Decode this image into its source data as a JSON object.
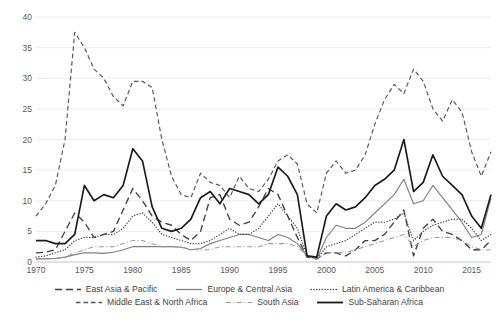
{
  "chart_data": {
    "type": "line",
    "title": "",
    "xlabel": "",
    "ylabel": "",
    "xlim": [
      1970,
      2017
    ],
    "ylim": [
      0,
      40
    ],
    "yticks": [
      0,
      5,
      10,
      15,
      20,
      25,
      30,
      35,
      40
    ],
    "xticks": [
      1970,
      1975,
      1980,
      1985,
      1990,
      1995,
      2000,
      2005,
      2010,
      2015
    ],
    "grid": "horizontal",
    "legend_position": "bottom",
    "x": [
      1970,
      1971,
      1972,
      1973,
      1974,
      1975,
      1976,
      1977,
      1978,
      1979,
      1980,
      1981,
      1982,
      1983,
      1984,
      1985,
      1986,
      1987,
      1988,
      1989,
      1990,
      1991,
      1992,
      1993,
      1994,
      1995,
      1996,
      1997,
      1998,
      1999,
      2000,
      2001,
      2002,
      2003,
      2004,
      2005,
      2006,
      2007,
      2008,
      2009,
      2010,
      2011,
      2012,
      2013,
      2014,
      2015,
      2016,
      2017
    ],
    "series": [
      {
        "name": "East Asia & Pacific",
        "style": "long-dash",
        "color": "#3f3f3f",
        "values": [
          1.5,
          1.6,
          2.0,
          5.0,
          8.0,
          6.5,
          4.0,
          4.5,
          5.0,
          8.5,
          12.0,
          10.0,
          7.5,
          6.5,
          6.0,
          4.5,
          3.5,
          5.0,
          10.5,
          11.0,
          7.0,
          6.0,
          6.5,
          9.0,
          12.0,
          11.0,
          7.5,
          4.0,
          0.8,
          0.5,
          1.5,
          1.5,
          1.0,
          2.0,
          3.5,
          3.5,
          4.5,
          6.5,
          8.5,
          1.0,
          5.5,
          7.0,
          5.0,
          4.5,
          3.5,
          2.0,
          2.0,
          3.5
        ]
      },
      {
        "name": "Europe & Central Asia",
        "style": "solid-thin",
        "color": "#7f7f7f",
        "values": [
          0.5,
          0.5,
          0.6,
          0.8,
          1.2,
          1.5,
          1.5,
          1.4,
          1.6,
          2.0,
          2.5,
          2.5,
          2.5,
          2.5,
          2.5,
          2.4,
          2.0,
          2.2,
          3.0,
          3.5,
          4.0,
          4.5,
          4.5,
          4.0,
          3.5,
          4.5,
          4.0,
          3.0,
          1.0,
          0.5,
          4.0,
          6.0,
          5.5,
          5.5,
          6.5,
          8.0,
          9.5,
          11.0,
          13.5,
          9.5,
          10.0,
          12.5,
          10.5,
          8.5,
          6.5,
          4.0,
          4.5,
          10.5
        ]
      },
      {
        "name": "Latin America & Caribbean",
        "style": "dotted",
        "color": "#4a4a4a",
        "values": [
          0.8,
          1.0,
          1.5,
          2.0,
          3.5,
          4.0,
          4.0,
          4.5,
          4.5,
          5.5,
          7.5,
          8.0,
          6.5,
          4.5,
          4.0,
          3.5,
          3.0,
          3.0,
          3.5,
          4.5,
          5.5,
          4.5,
          4.5,
          5.5,
          7.5,
          9.5,
          7.5,
          5.5,
          1.0,
          0.5,
          2.5,
          3.0,
          3.5,
          4.5,
          5.5,
          6.5,
          6.5,
          7.0,
          8.0,
          3.5,
          5.0,
          6.0,
          6.5,
          7.0,
          7.0,
          5.5,
          3.5,
          4.5
        ]
      },
      {
        "name": "Middle East & North Africa",
        "style": "dash",
        "color": "#555555",
        "values": [
          7.5,
          9.5,
          12.5,
          20.0,
          37.5,
          35.0,
          31.5,
          30.0,
          27.0,
          25.5,
          29.5,
          29.5,
          28.5,
          20.0,
          14.0,
          11.0,
          10.5,
          14.5,
          13.0,
          12.5,
          10.5,
          14.0,
          12.0,
          11.5,
          13.5,
          16.5,
          17.5,
          16.0,
          9.5,
          8.0,
          14.5,
          16.5,
          14.5,
          15.0,
          17.5,
          22.5,
          26.5,
          29.0,
          27.5,
          31.5,
          29.5,
          25.0,
          23.0,
          26.5,
          24.5,
          18.0,
          14.0,
          18.0
        ]
      },
      {
        "name": "South Asia",
        "style": "dash-dot",
        "color": "#9a9a9a",
        "values": [
          0.5,
          0.5,
          0.6,
          0.8,
          1.5,
          2.0,
          2.5,
          2.5,
          2.5,
          3.0,
          3.5,
          3.5,
          3.0,
          2.5,
          2.5,
          2.5,
          2.0,
          2.0,
          2.0,
          2.5,
          2.5,
          2.5,
          2.5,
          2.5,
          3.0,
          3.0,
          3.0,
          2.5,
          1.0,
          0.5,
          1.5,
          1.5,
          1.5,
          2.0,
          2.5,
          3.0,
          3.5,
          4.0,
          4.5,
          2.5,
          3.5,
          4.0,
          4.0,
          4.0,
          3.5,
          2.5,
          2.0,
          2.0
        ]
      },
      {
        "name": "Sub-Saharan Africa",
        "style": "solid-thick",
        "color": "#1a1a1a",
        "values": [
          3.5,
          3.5,
          3.0,
          3.0,
          4.5,
          12.5,
          10.0,
          11.0,
          10.5,
          12.5,
          18.5,
          16.5,
          9.0,
          5.5,
          5.0,
          5.5,
          7.0,
          10.5,
          11.5,
          9.5,
          12.0,
          11.5,
          11.0,
          9.5,
          11.0,
          15.5,
          14.0,
          11.0,
          1.0,
          0.8,
          7.5,
          9.5,
          8.5,
          9.0,
          10.5,
          12.5,
          13.5,
          15.0,
          20.0,
          11.5,
          13.0,
          17.5,
          14.0,
          12.5,
          11.0,
          7.5,
          5.5,
          11.0
        ]
      }
    ]
  },
  "axes": {
    "y_labels": [
      "40",
      "35",
      "30",
      "25",
      "20",
      "15",
      "10",
      "5",
      "0"
    ],
    "x_labels": [
      "1970",
      "1975",
      "1980",
      "1985",
      "1990",
      "1995",
      "2000",
      "2005",
      "2010",
      "2015"
    ]
  },
  "legend": {
    "rows": [
      [
        "East Asia & Pacific",
        "Europe & Central Asia",
        "Latin America & Caribbean"
      ],
      [
        "Middle East & North Africa",
        "South Asia",
        "Sub-Saharan Africa"
      ]
    ]
  },
  "caption": {
    "text": ""
  }
}
